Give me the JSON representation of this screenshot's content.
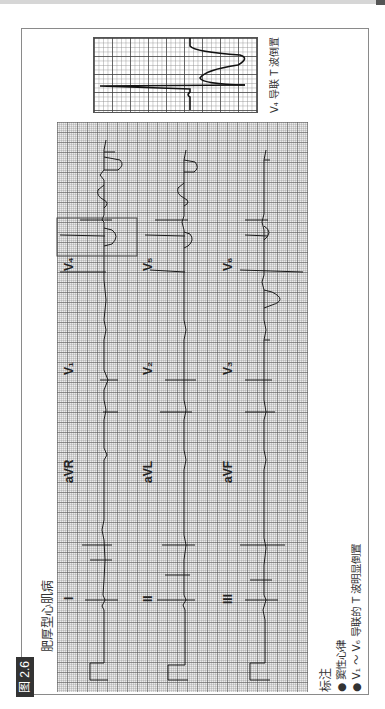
{
  "figure": {
    "number_label": "图 2.6",
    "title": "肥厚型心肌病",
    "orientation": "rotated 90° counter-clockwise"
  },
  "inset": {
    "caption": "V₄ 导联 T 波倒置"
  },
  "ecg": {
    "rows": [
      {
        "leads": [
          "I",
          "aVR",
          "V₁",
          "V₄"
        ]
      },
      {
        "leads": [
          "II",
          "aVL",
          "V₂",
          "V₅"
        ]
      },
      {
        "leads": [
          "III",
          "aVF",
          "V₃",
          "V₆"
        ]
      }
    ],
    "highlight_box_lead": "V₄"
  },
  "notes": {
    "heading": "标注",
    "items": [
      "窦性心律",
      "V₁ ～ V₆ 导联的 T 波明显倒置"
    ]
  },
  "colors": {
    "badge_bg": "#333333",
    "grid_bg": "#ececec",
    "trace": "#1a1a1a",
    "frame": "#8a8a8a"
  }
}
